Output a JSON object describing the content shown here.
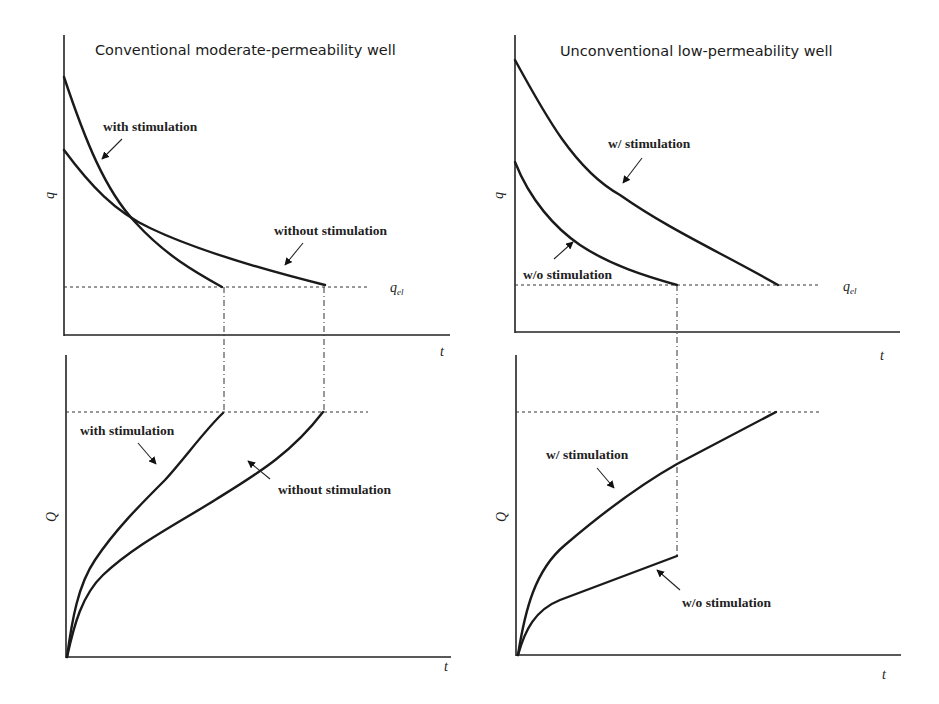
{
  "panels": {
    "top_left": {
      "title": "Conventional moderate-permeability well",
      "y_label": "q",
      "x_label": "t",
      "threshold_label": "q",
      "threshold_sub": "el",
      "curves": {
        "with": "with stimulation",
        "without": "without stimulation"
      }
    },
    "top_right": {
      "title": "Unconventional low-permeability well",
      "y_label": "q",
      "x_label": "t",
      "threshold_label": "q",
      "threshold_sub": "el",
      "curves": {
        "with": "w/ stimulation",
        "without": "w/o stimulation"
      }
    },
    "bottom_left": {
      "y_label": "Q",
      "x_label": "t",
      "curves": {
        "with": "with stimulation",
        "without": "without stimulation"
      }
    },
    "bottom_right": {
      "y_label": "Q",
      "x_label": "t",
      "curves": {
        "with": "w/ stimulation",
        "without": "w/o stimulation"
      }
    }
  },
  "colors": {
    "curve": "#1a1a1a",
    "background": "#ffffff"
  }
}
